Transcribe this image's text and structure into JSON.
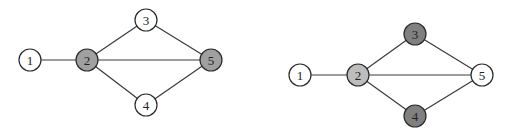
{
  "colors": {
    "white": "#ffffff",
    "light_gray": "#bdbdbd",
    "medium_gray": "#a0a0a0",
    "dark_gray": "#808080",
    "edge": "#3a3a3a"
  },
  "graphs": [
    {
      "id": "left-graph",
      "nodes": [
        {
          "label": "1",
          "x": 30,
          "y": 60,
          "fill": "#ffffff"
        },
        {
          "label": "2",
          "x": 87,
          "y": 60,
          "fill": "#a0a0a0"
        },
        {
          "label": "3",
          "x": 146,
          "y": 20,
          "fill": "#ffffff"
        },
        {
          "label": "4",
          "x": 146,
          "y": 105,
          "fill": "#ffffff"
        },
        {
          "label": "5",
          "x": 211,
          "y": 60,
          "fill": "#a0a0a0"
        }
      ],
      "edges": [
        [
          1,
          2
        ],
        [
          2,
          3
        ],
        [
          2,
          5
        ],
        [
          2,
          4
        ],
        [
          3,
          5
        ],
        [
          4,
          5
        ]
      ]
    },
    {
      "id": "right-graph",
      "nodes": [
        {
          "label": "1",
          "x": 300,
          "y": 75,
          "fill": "#ffffff"
        },
        {
          "label": "2",
          "x": 358,
          "y": 75,
          "fill": "#bdbdbd"
        },
        {
          "label": "3",
          "x": 415,
          "y": 34,
          "fill": "#808080"
        },
        {
          "label": "4",
          "x": 415,
          "y": 116,
          "fill": "#808080"
        },
        {
          "label": "5",
          "x": 482,
          "y": 75,
          "fill": "#ffffff"
        }
      ],
      "edges": [
        [
          1,
          2
        ],
        [
          2,
          3
        ],
        [
          2,
          5
        ],
        [
          2,
          4
        ],
        [
          3,
          5
        ],
        [
          4,
          5
        ]
      ]
    }
  ],
  "node_radius": 11
}
